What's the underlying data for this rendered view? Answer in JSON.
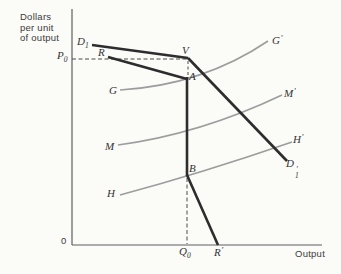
{
  "figure": {
    "width": 341,
    "height": 274,
    "bg": "#fbfbf8",
    "colors": {
      "dark": "#2d2d2d",
      "gray": "#9d9d9d",
      "axis": "#5f5f5f",
      "dash": "#4a4a4a",
      "text": "#3a3a3a"
    },
    "y_axis_label_lines": [
      "Dollars",
      "per unit",
      "of output"
    ]
  },
  "chart_data": {
    "type": "line",
    "xlabel": "Output",
    "ylabel": "Dollars per unit of output",
    "axes_numeric": false,
    "grid": false,
    "reference_labels": {
      "price_axis": "P0",
      "quantity_axis": "Q0",
      "origin": "0"
    },
    "marked_points": [
      "V",
      "A",
      "B"
    ],
    "axes": [
      {
        "name": "y-axis",
        "color": "axis",
        "width": 1.2,
        "points": [
          [
            72,
            9
          ],
          [
            72,
            245
          ]
        ]
      },
      {
        "name": "x-axis",
        "color": "axis",
        "width": 1.2,
        "points": [
          [
            72,
            245
          ],
          [
            322,
            245
          ]
        ]
      }
    ],
    "dashed_guides": [
      {
        "name": "p0-price-guide",
        "color": "dash",
        "width": 1,
        "dash": "4,2.5",
        "points": [
          [
            72,
            59
          ],
          [
            187,
            59
          ]
        ]
      },
      {
        "name": "v-a-kink-guide",
        "color": "dash",
        "width": 1,
        "dash": "3,2.5",
        "points": [
          [
            188,
            61
          ],
          [
            188,
            77
          ]
        ]
      },
      {
        "name": "q0-quantity-guide",
        "color": "dash",
        "width": 1,
        "dash": "4,2.5",
        "points": [
          [
            187,
            178
          ],
          [
            187,
            244
          ]
        ]
      }
    ],
    "series": [
      {
        "name": "mc-curve-G",
        "role": "cost-curve G-G'",
        "color": "gray",
        "width": 1.7,
        "points": [
          [
            120,
            90
          ],
          [
            268,
            41
          ]
        ],
        "ctrl": [
          203,
          85
        ]
      },
      {
        "name": "mc-curve-M",
        "role": "cost-curve M-M'",
        "color": "gray",
        "width": 1.7,
        "points": [
          [
            118,
            145
          ],
          [
            282,
            95
          ]
        ],
        "ctrl": [
          200,
          134
        ]
      },
      {
        "name": "mc-curve-H",
        "role": "cost-curve H-H'",
        "color": "gray",
        "width": 1.7,
        "points": [
          [
            120,
            195
          ],
          [
            292,
            142
          ]
        ],
        "ctrl": [
          202,
          173
        ]
      },
      {
        "name": "demand-curve-upper",
        "role": "demand D1 to kink V",
        "color": "dark",
        "width": 2.6,
        "points": [
          [
            92,
            45
          ],
          [
            188,
            58
          ]
        ]
      },
      {
        "name": "demand-curve-lower",
        "role": "demand kink V to D1'",
        "color": "dark",
        "width": 2.6,
        "points": [
          [
            188,
            58
          ],
          [
            287,
            161
          ]
        ]
      },
      {
        "name": "mr-curve-upper",
        "role": "marginal revenue R to A",
        "color": "dark",
        "width": 2.6,
        "points": [
          [
            108,
            57
          ],
          [
            187,
            79
          ]
        ]
      },
      {
        "name": "mr-vertical-gap",
        "role": "marginal revenue gap A to B",
        "color": "dark",
        "width": 2.6,
        "points": [
          [
            187,
            77
          ],
          [
            187,
            176
          ]
        ]
      },
      {
        "name": "mr-curve-lower",
        "role": "marginal revenue B to R'",
        "color": "dark",
        "width": 2.6,
        "points": [
          [
            187,
            175
          ],
          [
            218,
            245
          ]
        ]
      }
    ]
  },
  "labels": [
    {
      "id": "label-D1",
      "base": "D",
      "sub": "1",
      "x": 77,
      "y": 36,
      "font": "math"
    },
    {
      "id": "label-R",
      "base": "R",
      "x": 98,
      "y": 47,
      "font": "math"
    },
    {
      "id": "label-V",
      "base": "V",
      "x": 182,
      "y": 45,
      "font": "math"
    },
    {
      "id": "label-P0",
      "base": "P",
      "sub": "0",
      "x": 57,
      "y": 50,
      "font": "math"
    },
    {
      "id": "label-G",
      "base": "G",
      "x": 109,
      "y": 85,
      "font": "math"
    },
    {
      "id": "label-A",
      "base": "A",
      "x": 189,
      "y": 71,
      "font": "math"
    },
    {
      "id": "label-G-prime",
      "base": "G",
      "prime": "′",
      "x": 272,
      "y": 33,
      "font": "math"
    },
    {
      "id": "label-M",
      "base": "M",
      "x": 105,
      "y": 141,
      "font": "math"
    },
    {
      "id": "label-M-prime",
      "base": "M",
      "prime": "′",
      "x": 284,
      "y": 86,
      "font": "math"
    },
    {
      "id": "label-H",
      "base": "H",
      "x": 107,
      "y": 188,
      "font": "math"
    },
    {
      "id": "label-H-prime",
      "base": "H",
      "prime": "′",
      "x": 293,
      "y": 132,
      "font": "math"
    },
    {
      "id": "label-B",
      "base": "B",
      "x": 189,
      "y": 163,
      "font": "math"
    },
    {
      "id": "label-D1-prime",
      "base": "D",
      "sub": "1",
      "prime": "′",
      "stack": true,
      "x": 286,
      "y": 158,
      "font": "math"
    },
    {
      "id": "label-Q0",
      "base": "Q",
      "sub": "0",
      "x": 179,
      "y": 246,
      "font": "math"
    },
    {
      "id": "label-R-prime",
      "base": "R",
      "prime": "′",
      "x": 214,
      "y": 245,
      "font": "math"
    },
    {
      "id": "label-origin",
      "base": "0",
      "x": 61,
      "y": 236,
      "font": "sans"
    },
    {
      "id": "label-output",
      "base": "Output",
      "x": 295,
      "y": 249,
      "font": "sans"
    }
  ]
}
